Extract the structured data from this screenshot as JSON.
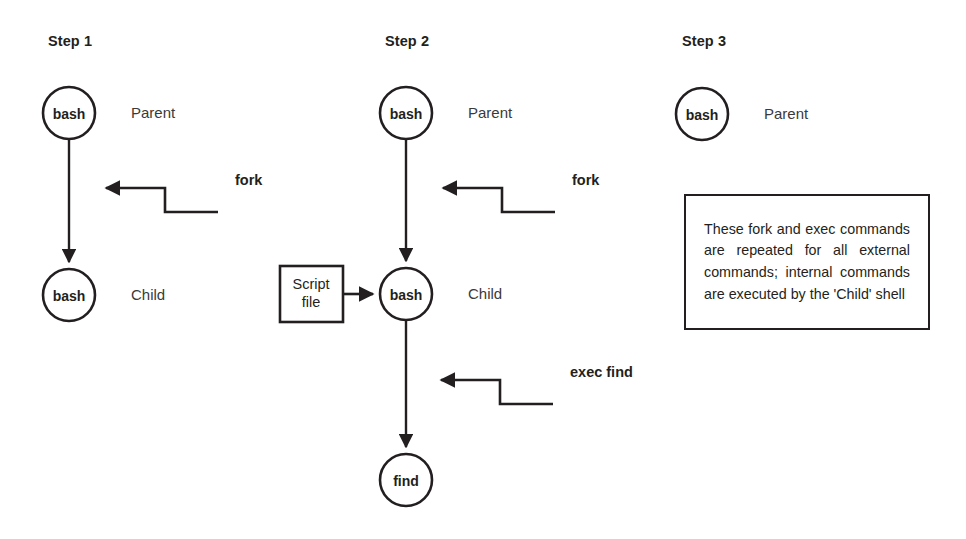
{
  "diagram": {
    "background_color": "#ffffff",
    "stroke_color": "#231f20",
    "columns": [
      {
        "id": "step-1",
        "heading": "Step 1",
        "nodes": [
          {
            "id": "s1-parent",
            "label": "bash",
            "role": "Parent",
            "shape": "circle"
          },
          {
            "id": "s1-child",
            "label": "bash",
            "role": "Child",
            "shape": "circle"
          }
        ],
        "calls": [
          {
            "id": "s1-fork",
            "label": "fork"
          }
        ]
      },
      {
        "id": "step-2",
        "heading": "Step 2",
        "nodes": [
          {
            "id": "s2-parent",
            "label": "bash",
            "role": "Parent",
            "shape": "circle"
          },
          {
            "id": "s2-child",
            "label": "bash",
            "role": "Child",
            "shape": "circle"
          },
          {
            "id": "s2-script",
            "label": "Script\nfile",
            "role": "",
            "shape": "rect"
          },
          {
            "id": "s2-find",
            "label": "find",
            "role": "",
            "shape": "circle"
          }
        ],
        "calls": [
          {
            "id": "s2-fork",
            "label": "fork"
          },
          {
            "id": "s2-exec",
            "label": "exec find"
          }
        ]
      },
      {
        "id": "step-3",
        "heading": "Step 3",
        "nodes": [
          {
            "id": "s3-parent",
            "label": "bash",
            "role": "Parent",
            "shape": "circle"
          }
        ],
        "calls": [],
        "note": "These fork and exec commands are repeated for all external commands; internal commands are executed by the 'Child' shell"
      }
    ]
  }
}
